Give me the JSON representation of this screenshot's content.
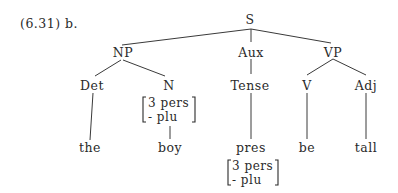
{
  "example_label": "(6.31) b.",
  "tree": {
    "S": "S",
    "NP": "NP",
    "Aux": "Aux",
    "VP": "VP",
    "Det": "Det",
    "N": "N",
    "Tense": "Tense",
    "V": "V",
    "Adj": "Adj",
    "the": "the",
    "boy": "boy",
    "pres": "pres",
    "be": "be",
    "tall": "tall"
  },
  "features": {
    "N": [
      "3 pers",
      "- plu"
    ],
    "pres": [
      "3 pers",
      "- plu"
    ]
  }
}
